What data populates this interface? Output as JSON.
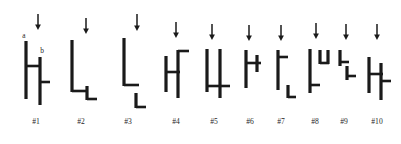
{
  "figure": {
    "kind": "line-drawing-stimulus-set",
    "background_color": "#ffffff",
    "ink_color": "#1a1a1a",
    "arrow_color": "#1a1a1a",
    "stroke_width_px": 3.2,
    "thin_stroke_width_px": 2.6,
    "annotations": {
      "a_label": "a",
      "b_label": "b"
    },
    "captions": [
      "#1",
      "#2",
      "#3",
      "#4",
      "#5",
      "#6",
      "#7",
      "#8",
      "#9",
      "#10"
    ],
    "caption_row_y": 124,
    "arrow_row_top_y": 14,
    "items": [
      {
        "id": "#1",
        "caption": "#1",
        "caption_x": 36,
        "arrow": {
          "x": 38,
          "y_top": 14,
          "y_bottom": 30
        },
        "has_a_label": true,
        "a_label_x": 24,
        "a_label_y": 38,
        "has_b_label": true,
        "b_label_x": 42,
        "b_label_y": 53,
        "strokes": [
          {
            "name": "left-vertical",
            "x1": 26,
            "y1": 41,
            "x2": 26,
            "y2": 99
          },
          {
            "name": "center-crossbar",
            "x1": 26,
            "y1": 66,
            "x2": 41,
            "y2": 66
          },
          {
            "name": "right-vertical",
            "x1": 40,
            "y1": 57,
            "x2": 40,
            "y2": 105
          },
          {
            "name": "right-tick",
            "x1": 40,
            "y1": 82,
            "x2": 50,
            "y2": 82
          }
        ]
      },
      {
        "id": "#2",
        "caption": "#2",
        "caption_x": 81,
        "arrow": {
          "x": 86,
          "y_top": 18,
          "y_bottom": 34
        },
        "strokes": [
          {
            "name": "tall-vertical",
            "x1": 72,
            "y1": 40,
            "x2": 72,
            "y2": 92
          },
          {
            "name": "bottom-horizontal",
            "x1": 72,
            "y1": 91,
            "x2": 88,
            "y2": 91
          },
          {
            "name": "short-vertical",
            "x1": 87,
            "y1": 86,
            "x2": 87,
            "y2": 100
          },
          {
            "name": "foot-horizontal",
            "x1": 87,
            "y1": 99,
            "x2": 97,
            "y2": 99
          }
        ]
      },
      {
        "id": "#3",
        "caption": "#3",
        "caption_x": 128,
        "arrow": {
          "x": 137,
          "y_top": 14,
          "y_bottom": 31
        },
        "strokes": [
          {
            "name": "tall-vertical",
            "x1": 124,
            "y1": 38,
            "x2": 124,
            "y2": 86
          },
          {
            "name": "mid-horizontal",
            "x1": 124,
            "y1": 85,
            "x2": 139,
            "y2": 85
          },
          {
            "name": "lower-vertical",
            "x1": 136,
            "y1": 93,
            "x2": 136,
            "y2": 108
          },
          {
            "name": "foot-horizontal",
            "x1": 136,
            "y1": 107,
            "x2": 146,
            "y2": 107
          }
        ]
      },
      {
        "id": "#4",
        "caption": "#4",
        "caption_x": 176,
        "arrow": {
          "x": 176,
          "y_top": 22,
          "y_bottom": 38
        },
        "strokes": [
          {
            "name": "left-vertical",
            "x1": 166,
            "y1": 56,
            "x2": 166,
            "y2": 92
          },
          {
            "name": "crossbar",
            "x1": 166,
            "y1": 72,
            "x2": 180,
            "y2": 72
          },
          {
            "name": "right-vertical",
            "x1": 178,
            "y1": 50,
            "x2": 178,
            "y2": 98
          },
          {
            "name": "top-right-tick",
            "x1": 178,
            "y1": 51,
            "x2": 189,
            "y2": 51
          }
        ]
      },
      {
        "id": "#5",
        "caption": "#5",
        "caption_x": 214,
        "arrow": {
          "x": 212,
          "y_top": 24,
          "y_bottom": 40
        },
        "strokes": [
          {
            "name": "left-vertical",
            "x1": 207,
            "y1": 49,
            "x2": 207,
            "y2": 92
          },
          {
            "name": "right-vertical",
            "x1": 220,
            "y1": 49,
            "x2": 220,
            "y2": 98
          },
          {
            "name": "crossbar",
            "x1": 207,
            "y1": 86,
            "x2": 230,
            "y2": 86
          }
        ]
      },
      {
        "id": "#6",
        "caption": "#6",
        "caption_x": 250,
        "arrow": {
          "x": 249,
          "y_top": 25,
          "y_bottom": 41
        },
        "strokes": [
          {
            "name": "left-vertical",
            "x1": 246,
            "y1": 50,
            "x2": 246,
            "y2": 88
          },
          {
            "name": "crossbar",
            "x1": 246,
            "y1": 63,
            "x2": 261,
            "y2": 63
          },
          {
            "name": "short-vertical",
            "x1": 257,
            "y1": 55,
            "x2": 257,
            "y2": 72
          }
        ]
      },
      {
        "id": "#7",
        "caption": "#7",
        "caption_x": 281,
        "arrow": {
          "x": 281,
          "y_top": 25,
          "y_bottom": 41
        },
        "strokes": [
          {
            "name": "left-vertical",
            "x1": 278,
            "y1": 50,
            "x2": 278,
            "y2": 90
          },
          {
            "name": "top-right-tick",
            "x1": 278,
            "y1": 57,
            "x2": 288,
            "y2": 57
          },
          {
            "name": "lower-vertical",
            "x1": 288,
            "y1": 85,
            "x2": 288,
            "y2": 98
          },
          {
            "name": "foot-horizontal",
            "x1": 288,
            "y1": 97,
            "x2": 296,
            "y2": 97
          }
        ]
      },
      {
        "id": "#8",
        "caption": "#8",
        "caption_x": 315,
        "arrow": {
          "x": 316,
          "y_top": 23,
          "y_bottom": 39
        },
        "strokes": [
          {
            "name": "left-vertical",
            "x1": 310,
            "y1": 49,
            "x2": 310,
            "y2": 93
          },
          {
            "name": "bottom-tick",
            "x1": 310,
            "y1": 85,
            "x2": 320,
            "y2": 85
          },
          {
            "name": "upper-vertical",
            "x1": 320,
            "y1": 50,
            "x2": 320,
            "y2": 64
          },
          {
            "name": "upper-horizontal",
            "x1": 320,
            "y1": 63,
            "x2": 329,
            "y2": 63
          },
          {
            "name": "upper-right-cap",
            "x1": 328,
            "y1": 50,
            "x2": 328,
            "y2": 64
          }
        ]
      },
      {
        "id": "#9",
        "caption": "#9",
        "caption_x": 344,
        "arrow": {
          "x": 346,
          "y_top": 24,
          "y_bottom": 40
        },
        "strokes": [
          {
            "name": "upper-vertical",
            "x1": 340,
            "y1": 50,
            "x2": 340,
            "y2": 66
          },
          {
            "name": "upper-horizontal",
            "x1": 340,
            "y1": 62,
            "x2": 349,
            "y2": 62
          },
          {
            "name": "lower-vertical",
            "x1": 347,
            "y1": 66,
            "x2": 347,
            "y2": 80
          },
          {
            "name": "lower-horizontal",
            "x1": 347,
            "y1": 76,
            "x2": 356,
            "y2": 76
          }
        ]
      },
      {
        "id": "#10",
        "caption": "#10",
        "caption_x": 377,
        "arrow": {
          "x": 377,
          "y_top": 24,
          "y_bottom": 40
        },
        "strokes": [
          {
            "name": "left-vertical",
            "x1": 369,
            "y1": 57,
            "x2": 369,
            "y2": 93
          },
          {
            "name": "crossbar",
            "x1": 369,
            "y1": 74,
            "x2": 383,
            "y2": 74
          },
          {
            "name": "right-vertical",
            "x1": 381,
            "y1": 63,
            "x2": 381,
            "y2": 100
          },
          {
            "name": "right-tick",
            "x1": 381,
            "y1": 81,
            "x2": 391,
            "y2": 81
          }
        ]
      }
    ]
  }
}
